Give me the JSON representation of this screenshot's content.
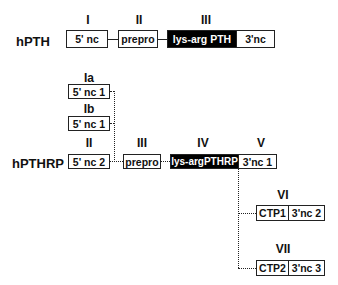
{
  "hPTH": {
    "label": "hPTH",
    "exon_labels": [
      "I",
      "II",
      "III"
    ],
    "boxes": [
      "5' nc",
      "prepro",
      "lys-arg PTH",
      "3'nc"
    ]
  },
  "hPTHRP": {
    "label": "hPTHRP",
    "exon_labels": {
      "Ia": "Ia",
      "Ib": "Ib",
      "II": "II",
      "III": "III",
      "IV": "IV",
      "V": "V",
      "VI": "VI",
      "VII": "VII"
    },
    "boxes": {
      "ia": "5' nc 1",
      "ib": "5' nc 1",
      "ii": "5' nc 2",
      "iii": "prepro",
      "iv": "lys-argPTHRP",
      "v": "3'nc 1",
      "vi_a": "CTP1",
      "vi_b": "3'nc 2",
      "vii_a": "CTP2",
      "vii_b": "3'nc 3"
    }
  },
  "colors": {
    "coding": "#000000",
    "noncoding": "#ffffff",
    "line": "#222222"
  }
}
